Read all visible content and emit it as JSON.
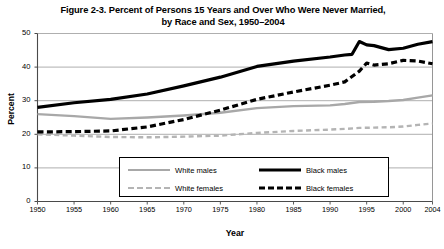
{
  "figure": {
    "title_line1": "Figure 2-3. Percent of Persons 15 Years and Over Who Were Never Married,",
    "title_line2": "by Race and Sex, 1950–2004"
  },
  "chart_data": {
    "type": "line",
    "title": "Figure 2-3. Percent of Persons 15 Years and Over Who Were Never Married, by Race and Sex, 1950–2004",
    "xlabel": "Year",
    "ylabel": "Percent",
    "xlim": [
      1950,
      2004
    ],
    "ylim": [
      0,
      50
    ],
    "yticks": [
      0,
      10,
      20,
      30,
      40,
      50
    ],
    "ytick_labels": [
      "0",
      "10",
      "20",
      "30",
      "40",
      "50"
    ],
    "xticks": [
      1950,
      1955,
      1960,
      1965,
      1970,
      1975,
      1980,
      1985,
      1990,
      1995,
      2000,
      2004
    ],
    "xtick_labels": [
      "1950",
      "1955",
      "1960",
      "1965",
      "1970",
      "1975",
      "1980",
      "1985",
      "1990",
      "1995",
      "2000",
      "2004"
    ],
    "grid": "horizontal",
    "legend_position": "inside-bottom-center",
    "series": [
      {
        "name": "White males",
        "color": "#a8a8a8",
        "style": "solid",
        "width": 2.4,
        "x": [
          1950,
          1955,
          1960,
          1965,
          1970,
          1975,
          1980,
          1985,
          1990,
          1992,
          1994,
          1996,
          1998,
          2000,
          2002,
          2004
        ],
        "values": [
          26.0,
          25.4,
          24.6,
          25.0,
          25.6,
          26.4,
          27.8,
          28.4,
          28.6,
          29.0,
          29.6,
          29.7,
          29.9,
          30.2,
          30.9,
          31.6
        ]
      },
      {
        "name": "Black males",
        "color": "#000000",
        "style": "solid",
        "width": 3.2,
        "x": [
          1950,
          1955,
          1960,
          1965,
          1970,
          1975,
          1980,
          1985,
          1990,
          1992,
          1993,
          1994,
          1995,
          1996,
          1998,
          2000,
          2002,
          2004
        ],
        "values": [
          28.0,
          29.4,
          30.4,
          32.0,
          34.4,
          37.0,
          40.2,
          41.8,
          43.0,
          43.6,
          43.8,
          47.6,
          46.6,
          46.4,
          45.2,
          45.6,
          46.8,
          47.6
        ]
      },
      {
        "name": "White females",
        "color": "#b4b4b4",
        "style": "dashed",
        "width": 2.4,
        "x": [
          1950,
          1955,
          1960,
          1965,
          1970,
          1975,
          1980,
          1985,
          1990,
          1992,
          1994,
          1996,
          1998,
          2000,
          2002,
          2004
        ],
        "values": [
          20.0,
          19.6,
          19.2,
          19.1,
          19.3,
          19.6,
          20.4,
          21.0,
          21.4,
          21.6,
          21.9,
          22.0,
          22.1,
          22.3,
          22.8,
          23.2
        ]
      },
      {
        "name": "Black females",
        "color": "#000000",
        "style": "dashed",
        "width": 3.2,
        "x": [
          1950,
          1955,
          1960,
          1965,
          1970,
          1975,
          1980,
          1985,
          1990,
          1992,
          1994,
          1995,
          1996,
          1998,
          2000,
          2002,
          2004
        ],
        "values": [
          20.7,
          20.8,
          21.0,
          22.2,
          24.4,
          27.2,
          30.4,
          32.6,
          34.6,
          35.6,
          38.8,
          41.2,
          40.6,
          41.0,
          42.0,
          41.8,
          41.0
        ]
      }
    ]
  },
  "legend": {
    "items": [
      {
        "label": "White males",
        "swatch": "solid-gray-line-icon"
      },
      {
        "label": "Black males",
        "swatch": "solid-black-line-icon"
      },
      {
        "label": "White females",
        "swatch": "dashed-gray-line-icon"
      },
      {
        "label": "Black females",
        "swatch": "dashed-black-line-icon"
      }
    ]
  }
}
